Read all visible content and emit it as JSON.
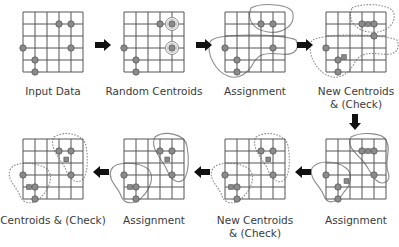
{
  "diagram": {
    "colors": {
      "grid": "#555555",
      "point_fill": "#8a8a8a",
      "point_stroke": "#5a5a5a",
      "centroid_fill": "#8a8a8a",
      "cluster_outline": "#8c8c8c",
      "arrow": "#111111",
      "text": "#3a3a3a"
    },
    "grid": {
      "cols": 5,
      "rows": 5,
      "cell": 12
    },
    "panels": [
      {
        "id": "input-data",
        "origin": [
          23,
          12
        ],
        "labels": [
          "Input Data"
        ],
        "label_pos": [
          53,
          85
        ],
        "points": [
          [
            3,
            1
          ],
          [
            4,
            1
          ],
          [
            0,
            3
          ],
          [
            4,
            3
          ],
          [
            1,
            4
          ],
          [
            1,
            5
          ]
        ],
        "centroids_ring": [],
        "centroids_square": [],
        "outlines": []
      },
      {
        "id": "random-centroids",
        "origin": [
          124,
          12
        ],
        "labels": [
          "Random Centroids"
        ],
        "label_pos": [
          154,
          85
        ],
        "points": [
          [
            3,
            1
          ],
          [
            4,
            1
          ],
          [
            0,
            3
          ],
          [
            4,
            3
          ],
          [
            1,
            4
          ],
          [
            1,
            5
          ]
        ],
        "centroids_ring": [
          [
            4,
            1
          ],
          [
            4,
            3
          ]
        ],
        "centroids_square": [],
        "outlines": []
      },
      {
        "id": "assignment-1",
        "origin": [
          225,
          12
        ],
        "labels": [
          "Assignment"
        ],
        "label_pos": [
          255,
          85
        ],
        "points": [
          [
            3,
            1
          ],
          [
            4,
            1
          ],
          [
            0,
            3
          ],
          [
            4,
            3
          ],
          [
            1,
            4
          ],
          [
            1,
            5
          ]
        ],
        "centroids_ring": [],
        "centroids_square": [],
        "outlines": [
          {
            "d": "M 251 8 C 262 2, 292 4, 293 14 C 295 26, 282 34, 268 32 C 254 30, 246 20, 251 8 Z",
            "dashed": false
          },
          {
            "d": "M 210 42 C 215 32, 285 34, 296 40 C 300 50, 294 56, 280 54 C 262 52, 258 56, 254 62 C 248 74, 238 80, 228 76 C 216 72, 206 54, 210 42 Z",
            "dashed": false
          }
        ]
      },
      {
        "id": "new-centroids-1",
        "origin": [
          326,
          12
        ],
        "labels": [
          "New Centroids",
          "& (Check)"
        ],
        "label_pos": [
          356,
          85
        ],
        "points": [
          [
            3,
            1
          ],
          [
            4,
            1
          ],
          [
            0,
            3
          ],
          [
            4,
            2
          ],
          [
            1,
            4
          ],
          [
            1,
            5
          ]
        ],
        "centroids_ring": [],
        "centroids_square": [
          [
            3.5,
            1
          ],
          [
            1.5,
            3.75
          ]
        ],
        "outlines": [
          {
            "d": "M 352 8 C 363 2, 393 4, 394 14 C 396 26, 383 34, 369 32 C 355 30, 347 20, 352 8 Z",
            "dashed": true
          },
          {
            "d": "M 311 42 C 316 32, 386 34, 397 40 C 401 50, 395 56, 381 54 C 363 52, 359 56, 355 62 C 349 74, 339 80, 329 76 C 317 72, 307 54, 311 42 Z",
            "dashed": true
          }
        ]
      },
      {
        "id": "assignment-2",
        "origin": [
          326,
          139
        ],
        "labels": [
          "Assignment"
        ],
        "label_pos": [
          356,
          214
        ],
        "points": [
          [
            3,
            1
          ],
          [
            4,
            1
          ],
          [
            0,
            3
          ],
          [
            4,
            3
          ],
          [
            1,
            4
          ],
          [
            1,
            5
          ]
        ],
        "centroids_ring": [],
        "centroids_square": [
          [
            3.5,
            1
          ],
          [
            1.7,
            3.5
          ]
        ],
        "outlines": [
          {
            "d": "M 351 137 C 360 132, 382 132, 386 140 C 392 150, 384 160, 388 172 C 392 182, 382 186, 376 180 C 370 174, 368 166, 362 160 C 354 152, 346 144, 351 137 Z",
            "dashed": false
          },
          {
            "d": "M 312 168 C 318 160, 336 160, 346 168 C 354 174, 350 186, 344 192 C 338 202, 328 206, 324 196 C 322 188, 308 178, 312 168 Z",
            "dashed": false
          }
        ]
      },
      {
        "id": "new-centroids-2",
        "origin": [
          225,
          139
        ],
        "labels": [
          "New Centroids",
          "& (Check)"
        ],
        "label_pos": [
          255,
          214
        ],
        "points": [
          [
            3,
            1
          ],
          [
            4,
            1
          ],
          [
            0,
            3
          ],
          [
            4,
            3
          ],
          [
            1,
            4
          ],
          [
            1,
            5
          ]
        ],
        "centroids_ring": [],
        "centroids_square": [
          [
            3.6,
            1.7
          ],
          [
            0.5,
            4
          ]
        ],
        "outlines": [
          {
            "d": "M 256 137 C 266 130, 286 134, 288 146 C 290 158, 290 170, 286 178 C 280 186, 272 180, 268 170 C 264 160, 250 148, 256 137 Z",
            "dashed": true
          },
          {
            "d": "M 212 170 C 216 160, 242 162, 250 170 C 256 178, 250 190, 244 196 C 238 204, 226 206, 222 196 C 220 188, 208 180, 212 170 Z",
            "dashed": true
          }
        ]
      },
      {
        "id": "assignment-3",
        "origin": [
          124,
          139
        ],
        "labels": [
          "Assignment"
        ],
        "label_pos": [
          154,
          214
        ],
        "points": [
          [
            3,
            1
          ],
          [
            4,
            1
          ],
          [
            0,
            3
          ],
          [
            4,
            3
          ],
          [
            1,
            4
          ],
          [
            1,
            5
          ]
        ],
        "centroids_ring": [],
        "centroids_square": [
          [
            3.6,
            1.7
          ],
          [
            0.5,
            4
          ]
        ],
        "outlines": [
          {
            "d": "M 155 137 C 165 130, 185 134, 187 146 C 189 158, 189 170, 185 178 C 179 186, 171 180, 167 170 C 163 160, 149 148, 155 137 Z",
            "dashed": false
          },
          {
            "d": "M 111 170 C 115 160, 141 162, 149 170 C 155 178, 149 190, 143 196 C 137 204, 125 206, 121 196 C 119 188, 107 180, 111 170 Z",
            "dashed": false
          }
        ]
      },
      {
        "id": "centroids-check",
        "origin": [
          23,
          139
        ],
        "labels": [
          "Centroids & (Check)"
        ],
        "label_pos": [
          53,
          214
        ],
        "points": [
          [
            3,
            1
          ],
          [
            4,
            1
          ],
          [
            0,
            3
          ],
          [
            4,
            3
          ],
          [
            1,
            4
          ],
          [
            1,
            5
          ]
        ],
        "centroids_ring": [],
        "centroids_square": [
          [
            3.6,
            1.7
          ],
          [
            0.5,
            4
          ]
        ],
        "outlines": [
          {
            "d": "M 54 137 C 64 130, 84 134, 86 146 C 88 158, 88 170, 84 178 C 78 186, 70 180, 66 170 C 62 160, 48 148, 54 137 Z",
            "dashed": true
          },
          {
            "d": "M 10 170 C 14 160, 40 162, 48 170 C 54 178, 48 190, 42 196 C 36 204, 24 206, 20 196 C 18 188, 6 180, 10 170 Z",
            "dashed": true
          }
        ]
      }
    ],
    "arrows": [
      {
        "id": "arrow-1",
        "dir": "right",
        "x": 95,
        "y": 45
      },
      {
        "id": "arrow-2",
        "dir": "right",
        "x": 196,
        "y": 45
      },
      {
        "id": "arrow-3",
        "dir": "right",
        "x": 297,
        "y": 45
      },
      {
        "id": "arrow-4",
        "dir": "down",
        "x": 355,
        "y": 114
      },
      {
        "id": "arrow-5",
        "dir": "left",
        "x": 311,
        "y": 172
      },
      {
        "id": "arrow-6",
        "dir": "left",
        "x": 210,
        "y": 172
      },
      {
        "id": "arrow-7",
        "dir": "left",
        "x": 109,
        "y": 172
      }
    ]
  }
}
